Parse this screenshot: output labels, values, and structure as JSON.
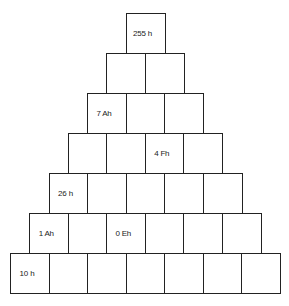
{
  "diagram": {
    "type": "number-pyramid",
    "rows": [
      {
        "cells": [
          "255 h"
        ]
      },
      {
        "cells": [
          "",
          ""
        ]
      },
      {
        "cells": [
          "7 Ah",
          "",
          ""
        ]
      },
      {
        "cells": [
          "",
          "",
          "4 Fh",
          ""
        ]
      },
      {
        "cells": [
          "26 h",
          "",
          "",
          "",
          ""
        ]
      },
      {
        "cells": [
          "1 Ah",
          "",
          "0 Eh",
          "",
          "",
          ""
        ]
      },
      {
        "cells": [
          "10 h",
          "",
          "",
          "",
          "",
          "",
          ""
        ]
      }
    ]
  }
}
